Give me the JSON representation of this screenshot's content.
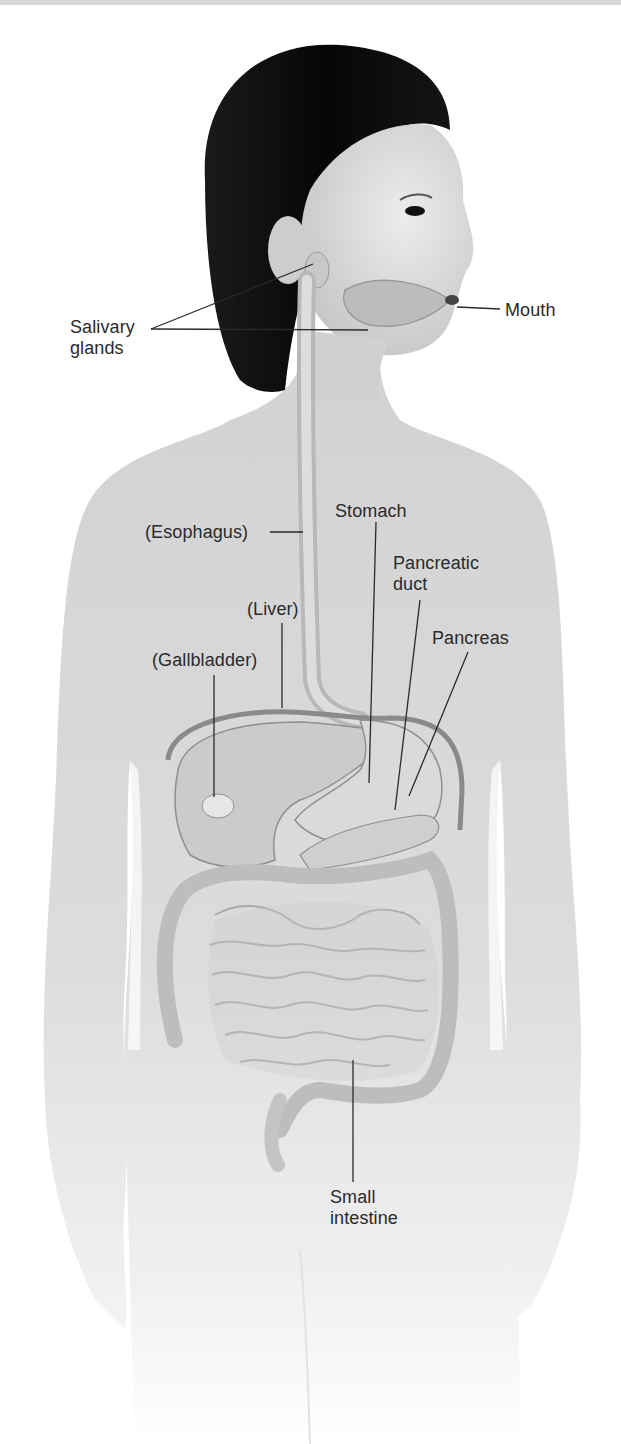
{
  "diagram": {
    "type": "anatomical-illustration",
    "colors": {
      "hair": "#0c0c0c",
      "skin_light": "#eaeaea",
      "skin_mid": "#cfcfcf",
      "organ_fill": "#d9d9d9",
      "label_text": "#2a2a2a",
      "leader_line": "#2a2a2a",
      "top_strip": "#d6d6d6"
    },
    "labels": [
      {
        "id": "salivary-glands",
        "text": "Salivary\nglands"
      },
      {
        "id": "mouth",
        "text": "Mouth"
      },
      {
        "id": "esophagus",
        "text": "(Esophagus)"
      },
      {
        "id": "stomach",
        "text": "Stomach"
      },
      {
        "id": "pancreatic-duct",
        "text": "Pancreatic\nduct"
      },
      {
        "id": "liver",
        "text": "(Liver)"
      },
      {
        "id": "pancreas",
        "text": "Pancreas"
      },
      {
        "id": "gallbladder",
        "text": "(Gallbladder)"
      },
      {
        "id": "small-intestine",
        "text": "Small\nintestine"
      }
    ]
  }
}
